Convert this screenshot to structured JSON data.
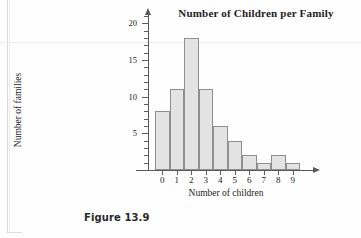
{
  "figure": {
    "caption": "Figure 13.9"
  },
  "chart_data": {
    "type": "bar",
    "title": "Number of Children per Family",
    "xlabel": "Number of children",
    "ylabel": "Number of families",
    "categories": [
      "0",
      "1",
      "2",
      "3",
      "4",
      "5",
      "6",
      "7",
      "8",
      "9"
    ],
    "values": [
      8,
      11,
      18,
      11,
      6,
      4,
      2,
      1,
      2,
      1
    ],
    "ylim": [
      0,
      21
    ],
    "ytick_labels": [
      "5",
      "10",
      "15",
      "20"
    ],
    "ytick_values": [
      5,
      10,
      15,
      20
    ],
    "yminor_step": 1,
    "xlim": [
      -0.5,
      9.5
    ],
    "grid": false,
    "legend": null,
    "bar_fill": "#e3e3e3",
    "bar_border": "#8e8e8e",
    "axis_color": "#595959",
    "text_color": "#1d1d1d"
  }
}
